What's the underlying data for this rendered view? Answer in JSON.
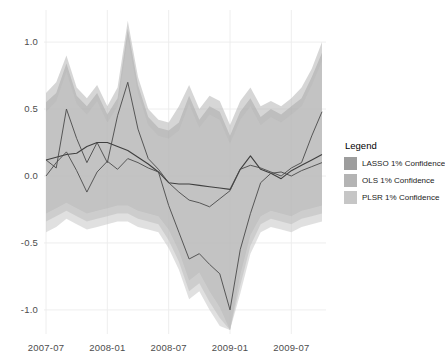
{
  "legend": {
    "title": "Legend",
    "entries": [
      {
        "label": "LASSO 1% Confidence",
        "color": "#9d9d9d"
      },
      {
        "label": "OLS 1% Confidence",
        "color": "#b4b4b4"
      },
      {
        "label": "PLSR 1% Confidence",
        "color": "#c6c6c6"
      }
    ]
  },
  "chart_data": {
    "type": "line",
    "title": "",
    "xlabel": "",
    "ylabel": "",
    "grid": true,
    "legend_position": "right",
    "ylim": [
      -1.15,
      1.15
    ],
    "yticks": [
      1.0,
      0.5,
      0.0,
      -0.5,
      -1.0
    ],
    "ytick_labels": [
      "1.0",
      "0.5",
      "0.0",
      "-0.5",
      "-1.0"
    ],
    "xticks": [
      "2007-07",
      "2008-01",
      "2008-07",
      "2009-01",
      "2009-07"
    ],
    "xtick_indices": [
      0,
      6,
      12,
      18,
      24
    ],
    "x": [
      "2007-07",
      "2007-08",
      "2007-09",
      "2007-10",
      "2007-11",
      "2007-12",
      "2008-01",
      "2008-02",
      "2008-03",
      "2008-04",
      "2008-05",
      "2008-06",
      "2008-07",
      "2008-08",
      "2008-09",
      "2008-10",
      "2008-11",
      "2008-12",
      "2009-01",
      "2009-02",
      "2009-03",
      "2009-04",
      "2009-05",
      "2009-06",
      "2009-07",
      "2009-08",
      "2009-09",
      "2009-10"
    ],
    "series": [
      {
        "name": "LASSO",
        "color": "#3f3f3f",
        "width": 1.1,
        "values": [
          0.12,
          0.14,
          0.16,
          0.17,
          0.22,
          0.25,
          0.25,
          0.22,
          0.19,
          0.14,
          0.09,
          0.03,
          -0.05,
          -0.06,
          -0.06,
          -0.07,
          -0.08,
          -0.09,
          -0.1,
          0.05,
          0.15,
          0.05,
          0.02,
          -0.02,
          0.04,
          0.08,
          0.12,
          0.16
        ]
      },
      {
        "name": "OLS",
        "color": "#4a4a4a",
        "width": 0.9,
        "values": [
          0.12,
          0.06,
          0.5,
          0.28,
          0.1,
          0.25,
          0.1,
          0.45,
          0.7,
          0.35,
          0.13,
          0.05,
          -0.05,
          -0.12,
          -0.18,
          -0.2,
          -0.23,
          -0.17,
          -0.11,
          0.05,
          0.08,
          0.06,
          0.03,
          0.0,
          0.06,
          0.1,
          0.3,
          0.48
        ]
      },
      {
        "name": "PLSR",
        "color": "#4a4a4a",
        "width": 0.9,
        "values": [
          0.0,
          0.1,
          0.18,
          0.04,
          -0.12,
          0.03,
          0.11,
          0.05,
          0.13,
          0.1,
          0.06,
          0.03,
          -0.22,
          -0.42,
          -0.62,
          -0.58,
          -0.66,
          -0.73,
          -1.0,
          -0.55,
          -0.28,
          -0.05,
          0.02,
          0.03,
          0.0,
          0.04,
          0.07,
          0.1
        ]
      }
    ],
    "bands": [
      {
        "name": "LASSO 1% Confidence",
        "color": "#9d9d9d",
        "opacity": 0.55,
        "upper": [
          0.55,
          0.62,
          0.84,
          0.6,
          0.52,
          0.62,
          0.46,
          0.58,
          1.1,
          0.68,
          0.44,
          0.36,
          0.34,
          0.4,
          0.6,
          0.42,
          0.52,
          0.48,
          0.3,
          0.48,
          0.58,
          0.44,
          0.5,
          0.46,
          0.52,
          0.58,
          0.74,
          0.92
        ],
        "lower": [
          -0.28,
          -0.24,
          -0.2,
          -0.24,
          -0.28,
          -0.26,
          -0.24,
          -0.22,
          -0.22,
          -0.26,
          -0.28,
          -0.3,
          -0.4,
          -0.56,
          -0.78,
          -0.72,
          -0.86,
          -0.98,
          -1.15,
          -0.74,
          -0.44,
          -0.3,
          -0.26,
          -0.28,
          -0.3,
          -0.26,
          -0.24,
          -0.22
        ]
      },
      {
        "name": "OLS 1% Confidence",
        "color": "#b4b4b4",
        "opacity": 0.55,
        "upper": [
          0.62,
          0.7,
          0.9,
          0.66,
          0.58,
          0.68,
          0.52,
          0.66,
          1.16,
          0.74,
          0.5,
          0.42,
          0.4,
          0.52,
          0.68,
          0.5,
          0.6,
          0.56,
          0.38,
          0.56,
          0.66,
          0.52,
          0.56,
          0.52,
          0.58,
          0.66,
          0.8,
          1.0
        ],
        "lower": [
          -0.34,
          -0.3,
          -0.26,
          -0.3,
          -0.34,
          -0.32,
          -0.3,
          -0.28,
          -0.28,
          -0.32,
          -0.34,
          -0.36,
          -0.48,
          -0.64,
          -0.86,
          -0.8,
          -0.94,
          -1.06,
          -1.15,
          -0.82,
          -0.52,
          -0.36,
          -0.32,
          -0.34,
          -0.36,
          -0.32,
          -0.3,
          -0.28
        ]
      },
      {
        "name": "PLSR 1% Confidence",
        "color": "#c6c6c6",
        "opacity": 0.55,
        "upper": [
          0.48,
          0.56,
          0.78,
          0.54,
          0.46,
          0.56,
          0.4,
          0.52,
          1.04,
          0.62,
          0.38,
          0.3,
          0.28,
          0.34,
          0.54,
          0.36,
          0.46,
          0.42,
          0.24,
          0.42,
          0.52,
          0.38,
          0.44,
          0.4,
          0.46,
          0.52,
          0.68,
          0.86
        ],
        "lower": [
          -0.42,
          -0.38,
          -0.32,
          -0.36,
          -0.4,
          -0.38,
          -0.36,
          -0.34,
          -0.34,
          -0.38,
          -0.4,
          -0.42,
          -0.54,
          -0.7,
          -0.92,
          -0.86,
          -1.0,
          -1.12,
          -1.15,
          -0.88,
          -0.58,
          -0.42,
          -0.38,
          -0.4,
          -0.42,
          -0.38,
          -0.36,
          -0.34
        ]
      }
    ]
  }
}
